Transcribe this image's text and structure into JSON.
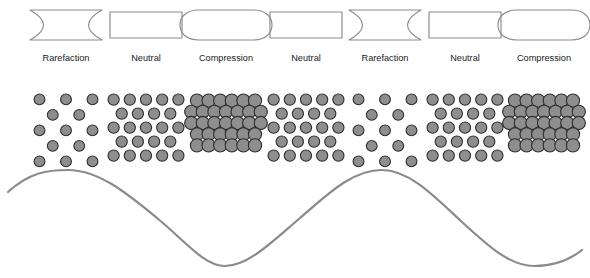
{
  "figure": {
    "width": 590,
    "height": 278,
    "background_color": "#ffffff",
    "outline_color": "#8b8b8b",
    "particle_fill_color": "#8e8e8e",
    "particle_stroke_color": "#2e2e2e",
    "wave_color": "#8b8b8b",
    "label_color": "#1a1a1a"
  },
  "zones": [
    {
      "index": 0,
      "label": "Rarefaction",
      "shape": "hourglass",
      "density": "sparse",
      "block_x": 30,
      "block_width": 72,
      "label_x": 66,
      "particle_rows": [
        3,
        2,
        3,
        2,
        3
      ]
    },
    {
      "index": 1,
      "label": "Neutral",
      "shape": "rectangle",
      "density": "medium",
      "block_x": 110,
      "block_width": 72,
      "label_x": 146,
      "particle_rows": [
        5,
        4,
        5,
        4,
        5
      ]
    },
    {
      "index": 2,
      "label": "Compression",
      "shape": "barrel",
      "density": "dense",
      "block_x": 188,
      "block_width": 76,
      "label_x": 226,
      "particle_rows": [
        6,
        7,
        7,
        6,
        6
      ]
    },
    {
      "index": 3,
      "label": "Neutral",
      "shape": "rectangle",
      "density": "medium",
      "block_x": 270,
      "block_width": 72,
      "label_x": 306,
      "particle_rows": [
        5,
        4,
        5,
        4,
        5
      ]
    },
    {
      "index": 4,
      "label": "Rarefaction",
      "shape": "hourglass",
      "density": "sparse",
      "block_x": 349,
      "block_width": 72,
      "label_x": 385,
      "particle_rows": [
        3,
        2,
        3,
        2,
        3
      ]
    },
    {
      "index": 5,
      "label": "Neutral",
      "shape": "rectangle",
      "density": "medium",
      "block_x": 429,
      "block_width": 72,
      "label_x": 465,
      "particle_rows": [
        5,
        4,
        5,
        4,
        5
      ]
    },
    {
      "index": 6,
      "label": "Compression",
      "shape": "barrel",
      "density": "dense",
      "block_x": 506,
      "block_width": 76,
      "label_x": 544,
      "particle_rows": [
        6,
        7,
        7,
        6,
        6
      ]
    }
  ],
  "layout": {
    "shape_row_top": 10,
    "shape_row_height": 30,
    "label_row_y": 59,
    "particle_row_top": 94,
    "particle_row_height": 62
  },
  "chart_data": {
    "type": "line",
    "xlabel": "",
    "ylabel": "",
    "grid": false,
    "legend": "none",
    "x_range_px": [
      8,
      582
    ],
    "y_range_px": [
      170,
      266
    ],
    "baseline_y_px": 218,
    "amplitude_px": 48,
    "wavelength_px": 314,
    "peaks_x_px": [
      68,
      382
    ],
    "troughs_x_px": [
      225,
      539
    ],
    "path": "M 8,192 C 30,172 48,170 68,170 C 100,170 130,196 157,218 C 184,240 204,266 225,266 C 248,266 272,242 300,218 C 328,194 352,170 382,170 C 410,170 436,198 462,222 C 488,246 510,266 534,266 C 556,266 572,258 582,250"
  }
}
